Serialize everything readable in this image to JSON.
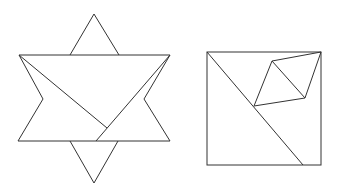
{
  "figures": [
    {
      "id": "star-figure",
      "description": "Six-pointed star composed of a rectangle with top and bottom triangles and side notches, with two internal diagonals",
      "stroke_color": "#333333"
    },
    {
      "id": "square-figure",
      "description": "Square with a corner-to-bottom diagonal and an inscribed rhombus attached to the top-right corner",
      "stroke_color": "#333333"
    }
  ]
}
